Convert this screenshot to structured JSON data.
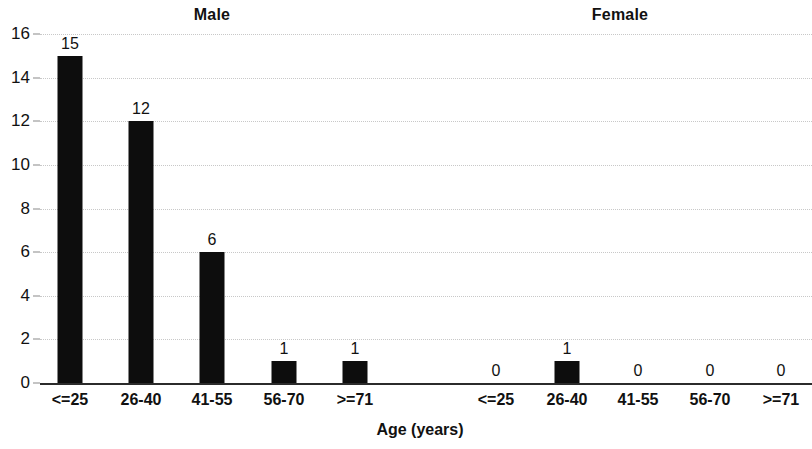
{
  "chart_data": {
    "type": "bar",
    "title": "",
    "xlabel": "Age (years)",
    "ylabel": "",
    "ylim": [
      0,
      16
    ],
    "yticks": [
      0,
      2,
      4,
      6,
      8,
      10,
      12,
      14,
      16
    ],
    "ytick_labels": [
      "0",
      "2",
      "4",
      "6",
      "8",
      "10",
      "12",
      "14",
      "16"
    ],
    "grid": true,
    "grid_axis": "y",
    "legend": "none",
    "panel_titles": [
      "Male",
      "Female"
    ],
    "categories": [
      "<=25",
      "26-40",
      "41-55",
      "56-70",
      ">=71"
    ],
    "series": [
      {
        "name": "Male",
        "values": [
          15,
          12,
          6,
          1,
          1
        ]
      },
      {
        "name": "Female",
        "values": [
          0,
          1,
          0,
          0,
          0
        ]
      }
    ],
    "bar_labels": {
      "male": [
        "15",
        "12",
        "6",
        "1",
        "1"
      ],
      "female": [
        "0",
        "1",
        "0",
        "0",
        "0"
      ]
    },
    "colors": {
      "bar": "#0d0d0d",
      "axis": "#2b2b2b",
      "grid": "#c8c8c8",
      "text": "#111111",
      "background": "#ffffff"
    }
  },
  "panels": [
    {
      "title": "Male",
      "title_x": 212,
      "bars": [
        {
          "category": "<=25",
          "value": 15,
          "label": "15",
          "x": 70
        },
        {
          "category": "26-40",
          "value": 12,
          "label": "12",
          "x": 141
        },
        {
          "category": "41-55",
          "value": 6,
          "label": "6",
          "x": 212
        },
        {
          "category": "56-70",
          "value": 1,
          "label": "1",
          "x": 284
        },
        {
          "category": ">=71",
          "value": 1,
          "label": "1",
          "x": 355
        }
      ]
    },
    {
      "title": "Female",
      "title_x": 620,
      "bars": [
        {
          "category": "<=25",
          "value": 0,
          "label": "0",
          "x": 496
        },
        {
          "category": "26-40",
          "value": 1,
          "label": "1",
          "x": 567
        },
        {
          "category": "41-55",
          "value": 0,
          "label": "0",
          "x": 638
        },
        {
          "category": "56-70",
          "value": 0,
          "label": "0",
          "x": 710
        },
        {
          "category": ">=71",
          "value": 0,
          "label": "0",
          "x": 781
        }
      ]
    }
  ],
  "axes": {
    "x_title": "Age (years)",
    "x_title_x": 420,
    "y_ticks": [
      {
        "label": "16",
        "value": 16
      },
      {
        "label": "14",
        "value": 14
      },
      {
        "label": "12",
        "value": 12
      },
      {
        "label": "10",
        "value": 10
      },
      {
        "label": "8",
        "value": 8
      },
      {
        "label": "6",
        "value": 6
      },
      {
        "label": "4",
        "value": 4
      },
      {
        "label": "2",
        "value": 2
      },
      {
        "label": "0",
        "value": 0
      }
    ]
  }
}
